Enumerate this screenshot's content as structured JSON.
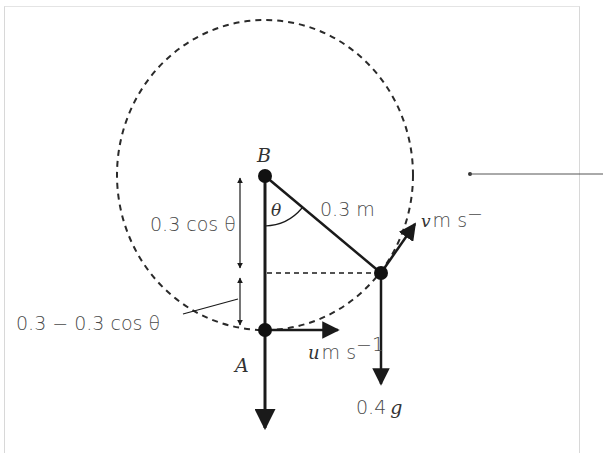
{
  "diagram": {
    "points": {
      "B": {
        "label": "B"
      },
      "A": {
        "label": "A"
      }
    },
    "labels": {
      "rod_length": "0.3 m",
      "angle": "θ",
      "vertical_upper": "0.3 cos θ",
      "vertical_lower": "0.3 − 0.3 cos θ",
      "velocity_bottom_var": "u",
      "velocity_bottom_unit": "m s",
      "velocity_bottom_exp": "−1",
      "velocity_side_var": "v",
      "velocity_side_unit": "m s",
      "velocity_side_exp": "−",
      "weight_num": "0.4",
      "weight_var": "g"
    },
    "colors": {
      "ink": "#1a1a1a",
      "text": "#4a4a4a",
      "frame": "#d8d8d8"
    }
  }
}
